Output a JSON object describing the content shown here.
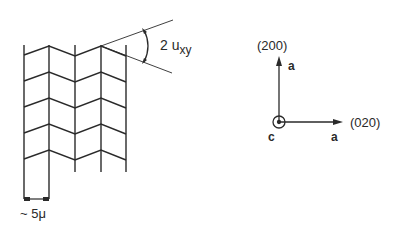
{
  "diagram": {
    "colors": {
      "ink": "#2a2a2a",
      "background": "#ffffff"
    },
    "domain_sketch": {
      "angle_label_main": "2 u",
      "angle_label_sub": "xy",
      "scale_label": "~ 5μ"
    },
    "axes": {
      "vertical_index": "(200)",
      "vertical_axis": "a",
      "horizontal_index": "(020)",
      "horizontal_axis": "a",
      "origin_axis": "c"
    }
  }
}
